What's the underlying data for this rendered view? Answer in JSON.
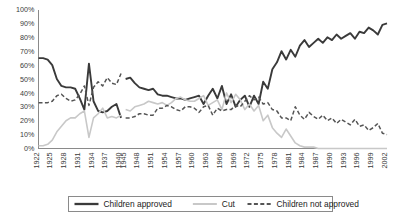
{
  "chart_data": {
    "type": "line",
    "title": "",
    "xlabel": "",
    "ylabel": "",
    "ylim": [
      0,
      100
    ],
    "ytick_labels": [
      "100%",
      "90%",
      "80%",
      "70%",
      "60%",
      "50%",
      "40%",
      "30%",
      "20%",
      "10%",
      "0%"
    ],
    "ytick_values": [
      100,
      90,
      80,
      70,
      60,
      50,
      40,
      30,
      20,
      10,
      0
    ],
    "grid": false,
    "legend_position": "bottom-center",
    "xtick_labels": [
      "1922",
      "1925",
      "1928",
      "1931",
      "1934",
      "1937",
      "1940",
      "1945",
      "1948",
      "1951",
      "1954",
      "1957",
      "1960",
      "1963",
      "1966",
      "1969",
      "1972",
      "1975",
      "1978",
      "1981",
      "1984",
      "1987",
      "1990",
      "1993",
      "1996",
      "1999",
      "2002"
    ],
    "x": [
      1922,
      1923,
      1924,
      1925,
      1926,
      1927,
      1928,
      1929,
      1930,
      1931,
      1932,
      1933,
      1934,
      1935,
      1936,
      1937,
      1938,
      1939,
      1940,
      1945,
      1946,
      1947,
      1948,
      1949,
      1950,
      1951,
      1952,
      1953,
      1954,
      1955,
      1956,
      1957,
      1958,
      1959,
      1960,
      1961,
      1962,
      1963,
      1964,
      1965,
      1966,
      1967,
      1968,
      1969,
      1970,
      1971,
      1972,
      1973,
      1974,
      1975,
      1976,
      1977,
      1978,
      1979,
      1980,
      1981,
      1982,
      1983,
      1984,
      1985,
      1986,
      1987,
      1988,
      1989,
      1990,
      1991,
      1992,
      1993,
      1994,
      1995,
      1996,
      1997,
      1998,
      1999,
      2000,
      2001,
      2002
    ],
    "series": [
      {
        "name": "Children approved",
        "style": "solid",
        "color": "#3a3a3a",
        "width": 1.9,
        "values": [
          65,
          65,
          64,
          60,
          50,
          45,
          44,
          44,
          43,
          36,
          28,
          61,
          34,
          27,
          26,
          27,
          30,
          32,
          22,
          50,
          51,
          47,
          44,
          43,
          42,
          43,
          39,
          38,
          38,
          37,
          36,
          36,
          35,
          36,
          37,
          38,
          32,
          38,
          43,
          36,
          45,
          32,
          39,
          30,
          35,
          38,
          30,
          38,
          32,
          48,
          43,
          57,
          62,
          70,
          64,
          71,
          66,
          74,
          78,
          73,
          76,
          79,
          76,
          80,
          78,
          82,
          79,
          81,
          83,
          79,
          84,
          83,
          87,
          85,
          82,
          89,
          90
        ]
      },
      {
        "name": "Cut",
        "style": "solid",
        "color": "#c8c8c8",
        "width": 1.6,
        "values": [
          2,
          2,
          3,
          6,
          12,
          16,
          20,
          22,
          22,
          25,
          27,
          8,
          22,
          25,
          29,
          22,
          23,
          22,
          24,
          28,
          27,
          30,
          31,
          32,
          34,
          33,
          32,
          33,
          31,
          33,
          36,
          37,
          35,
          34,
          34,
          36,
          38,
          31,
          33,
          35,
          28,
          40,
          33,
          39,
          35,
          28,
          32,
          27,
          31,
          20,
          24,
          15,
          11,
          8,
          14,
          9,
          4,
          2,
          1,
          1,
          1,
          0,
          0,
          0,
          0,
          0,
          0,
          0,
          0,
          0,
          0,
          0,
          0,
          0,
          0,
          0,
          0
        ]
      },
      {
        "name": "Children not approved",
        "style": "dashed",
        "color": "#555555",
        "width": 1.5,
        "values": [
          33,
          33,
          33,
          34,
          38,
          39,
          36,
          34,
          35,
          39,
          45,
          31,
          44,
          48,
          45,
          51,
          47,
          46,
          54,
          22,
          22,
          23,
          25,
          25,
          24,
          24,
          29,
          29,
          31,
          30,
          28,
          27,
          30,
          30,
          29,
          26,
          30,
          31,
          24,
          29,
          27,
          28,
          28,
          31,
          30,
          34,
          38,
          35,
          37,
          32,
          33,
          28,
          27,
          22,
          22,
          20,
          30,
          24,
          21,
          26,
          23,
          21,
          24,
          20,
          22,
          18,
          21,
          19,
          17,
          21,
          16,
          17,
          13,
          15,
          18,
          11,
          10
        ]
      }
    ],
    "gap_after_x": 1940,
    "gap_before_x": 1945
  },
  "legend": {
    "items": [
      {
        "label": "Children approved",
        "marker": "solid-dark-line-icon"
      },
      {
        "label": "Cut",
        "marker": "solid-light-line-icon"
      },
      {
        "label": "Children not approved",
        "marker": "dashed-line-icon"
      }
    ]
  }
}
